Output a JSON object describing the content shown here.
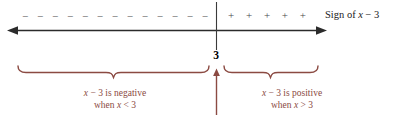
{
  "figure": {
    "type": "sign-chart-number-line",
    "axis_label": {
      "prefix": "Sign of ",
      "variable": "x",
      "operator": " − ",
      "constant": "3"
    },
    "critical_value": "3",
    "signs": {
      "negative_glyph": "−",
      "negative_count": 13,
      "positive_glyph": "+",
      "positive_count": 5
    },
    "regions": [
      {
        "name": "negative-region",
        "line1": "x − 3 is negative",
        "line2": "when x < 3",
        "expression": "x − 3",
        "state": "negative",
        "condition": "x < 3"
      },
      {
        "name": "positive-region",
        "line1": "x − 3 is positive",
        "line2": "when x > 3",
        "expression": "x − 3",
        "state": "positive",
        "condition": "x > 3"
      }
    ],
    "colors": {
      "axis": "#2b2b2b",
      "brace": "#8b4a42",
      "caption": "#8b4a42",
      "tick_value": "#000000",
      "sign_glyph": "#4a4a4a",
      "background": "#ffffff"
    }
  }
}
